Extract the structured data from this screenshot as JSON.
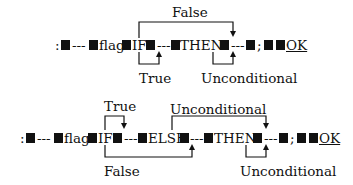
{
  "diagrams": [
    {
      "id": "if-then",
      "tokens": {
        "colon": ":",
        "dash1": "---",
        "flag": "flag",
        "if": "IF",
        "dash2": "---",
        "then": "THEN",
        "dash3": "---",
        "semicolon": ";",
        "ok": "OK"
      },
      "labels": {
        "false": "False",
        "true": "True",
        "unconditional": "Unconditional"
      }
    },
    {
      "id": "if-else-then",
      "tokens": {
        "colon": ":",
        "dash1": "---",
        "flag": "flag",
        "if": "IF",
        "dash2": "---",
        "else": "ELSE",
        "dash3": "---",
        "then": "THEN",
        "dash4": "---",
        "semicolon": ";",
        "ok": "OK"
      },
      "labels": {
        "true": "True",
        "unconditional_top": "Unconditional",
        "false": "False",
        "unconditional_bottom": "Unconditional"
      }
    }
  ]
}
